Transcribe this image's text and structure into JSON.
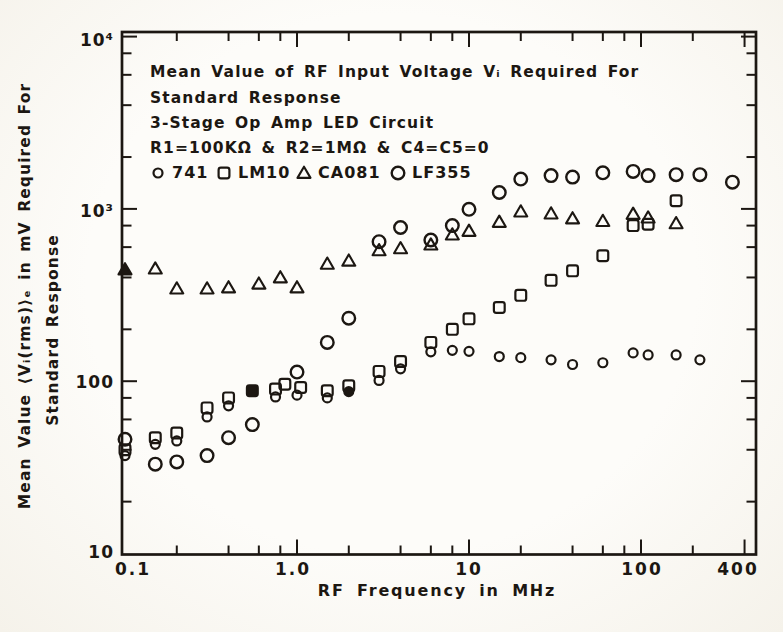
{
  "figure": {
    "ink": "#1c1712",
    "title_lines": {
      "line1": "Mean Value of RF Input Voltage Vᵢ Required For",
      "line2": "Standard Response",
      "line3": "3-Stage Op Amp LED Circuit",
      "line4": "R1=100KΩ & R2=1MΩ & C4=C5=0"
    },
    "legend": {
      "items": [
        {
          "label": "741",
          "marker": "circle-small"
        },
        {
          "label": "LM10",
          "marker": "square"
        },
        {
          "label": "CA081",
          "marker": "triangle"
        },
        {
          "label": "LF355",
          "marker": "circle-large"
        }
      ]
    },
    "x_axis": {
      "label": "RF Frequency in MHz",
      "tick_labels": [
        "0.1",
        "1.0",
        "10",
        "100",
        "400"
      ]
    },
    "y_axis": {
      "label_outer": "Mean Value ⟨Vᵢ(rms)⟩ₑ in mV Required For",
      "label_inner": "Standard Response",
      "tick_labels": [
        "10⁴",
        "10³",
        "100",
        "10"
      ]
    }
  },
  "chart_data": {
    "type": "scatter",
    "x_scale": "log",
    "y_scale": "log",
    "xlabel": "RF Frequency in MHz",
    "ylabel": "Mean Value ⟨Vi(rms)⟩ in mV Required For Standard Response",
    "x_unit": "MHz",
    "y_unit": "mV",
    "xlim": [
      0.096,
      470
    ],
    "ylim": [
      10,
      10800
    ],
    "grid": false,
    "legend_position": "top-left-inside",
    "x_ticks_labeled": [
      0.1,
      1,
      10,
      100,
      400
    ],
    "x_ticks_minor": [
      0.2,
      0.4,
      0.6,
      0.8,
      2,
      4,
      6,
      8,
      20,
      40,
      60,
      80,
      200
    ],
    "y_ticks_labeled": [
      10,
      100,
      1000,
      10000
    ],
    "y_ticks_minor": [
      20,
      40,
      60,
      80,
      200,
      400,
      600,
      800,
      2000,
      4000,
      6000,
      8000
    ],
    "series": [
      {
        "name": "741",
        "marker": "circle-small",
        "points": [
          [
            0.1,
            37
          ],
          [
            0.15,
            43
          ],
          [
            0.2,
            45
          ],
          [
            0.3,
            62
          ],
          [
            0.4,
            72
          ],
          [
            0.75,
            81
          ],
          [
            1.0,
            83
          ],
          [
            1.5,
            80
          ],
          [
            2,
            87,
            1
          ],
          [
            3,
            101
          ],
          [
            4,
            118
          ],
          [
            6,
            148
          ],
          [
            8,
            151
          ],
          [
            10,
            149
          ],
          [
            15,
            139
          ],
          [
            20,
            137
          ],
          [
            30,
            133
          ],
          [
            40,
            125
          ],
          [
            60,
            128
          ],
          [
            90,
            146
          ],
          [
            110,
            142
          ],
          [
            160,
            142
          ],
          [
            220,
            133
          ]
        ]
      },
      {
        "name": "LM10",
        "marker": "square",
        "points": [
          [
            0.1,
            40
          ],
          [
            0.15,
            47
          ],
          [
            0.2,
            50
          ],
          [
            0.3,
            70
          ],
          [
            0.4,
            80
          ],
          [
            0.55,
            88,
            1
          ],
          [
            0.75,
            90
          ],
          [
            0.85,
            96
          ],
          [
            1.05,
            92
          ],
          [
            1.5,
            88
          ],
          [
            2,
            94
          ],
          [
            3,
            114
          ],
          [
            4,
            130
          ],
          [
            6,
            168
          ],
          [
            8,
            200
          ],
          [
            10,
            230
          ],
          [
            15,
            268
          ],
          [
            20,
            315
          ],
          [
            30,
            385
          ],
          [
            40,
            437
          ],
          [
            60,
            535
          ],
          [
            90,
            800
          ],
          [
            110,
            815
          ],
          [
            160,
            1115
          ]
        ]
      },
      {
        "name": "CA081",
        "marker": "triangle",
        "points": [
          [
            0.1,
            445,
            1
          ],
          [
            0.15,
            450
          ],
          [
            0.2,
            345
          ],
          [
            0.3,
            345
          ],
          [
            0.4,
            350
          ],
          [
            0.6,
            368
          ],
          [
            0.8,
            400
          ],
          [
            1.0,
            350
          ],
          [
            1.5,
            480
          ],
          [
            2,
            500
          ],
          [
            3,
            575
          ],
          [
            4,
            590
          ],
          [
            6,
            620
          ],
          [
            8,
            710
          ],
          [
            10,
            745
          ],
          [
            15,
            840
          ],
          [
            20,
            965
          ],
          [
            30,
            940
          ],
          [
            40,
            880
          ],
          [
            60,
            850
          ],
          [
            90,
            935
          ],
          [
            110,
            890
          ],
          [
            160,
            825
          ]
        ]
      },
      {
        "name": "LF355",
        "marker": "circle-large",
        "points": [
          [
            0.1,
            46
          ],
          [
            0.15,
            33
          ],
          [
            0.2,
            34
          ],
          [
            0.3,
            37
          ],
          [
            0.4,
            47
          ],
          [
            0.55,
            56
          ],
          [
            1.0,
            113
          ],
          [
            1.5,
            168
          ],
          [
            2,
            232
          ],
          [
            3,
            645
          ],
          [
            4,
            780
          ],
          [
            6,
            660
          ],
          [
            8,
            800
          ],
          [
            10,
            995
          ],
          [
            15,
            1245
          ],
          [
            20,
            1490
          ],
          [
            30,
            1560
          ],
          [
            40,
            1530
          ],
          [
            60,
            1620
          ],
          [
            90,
            1650
          ],
          [
            110,
            1560
          ],
          [
            160,
            1580
          ],
          [
            220,
            1580
          ],
          [
            340,
            1430
          ]
        ]
      }
    ]
  }
}
